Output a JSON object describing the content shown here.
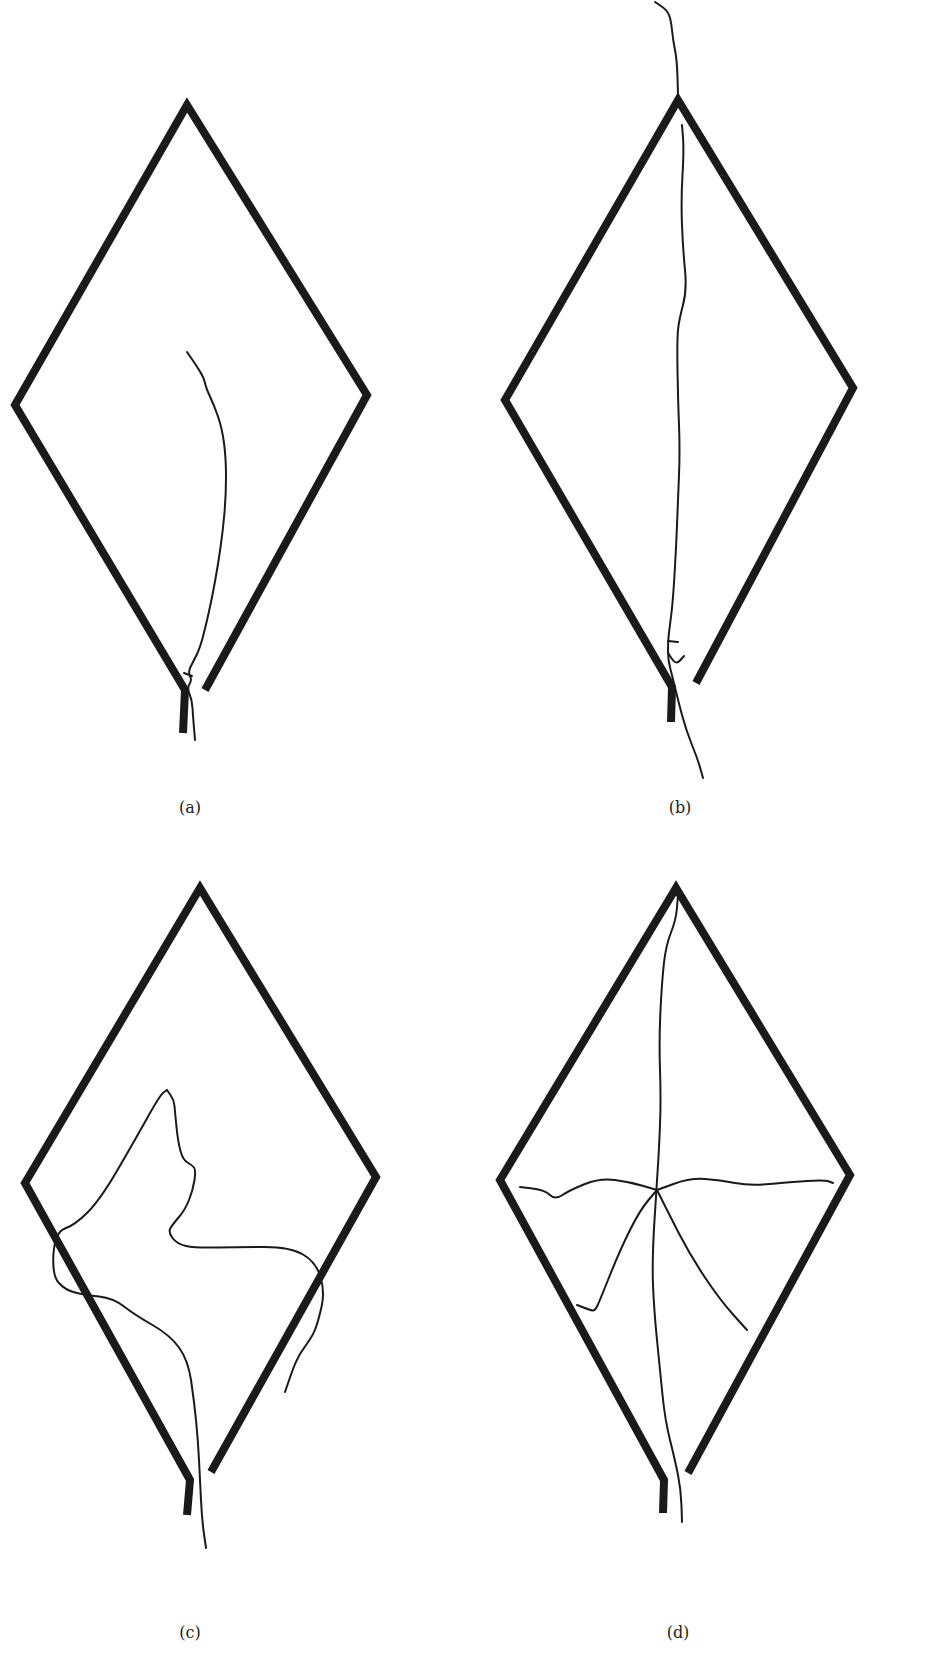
{
  "figure": {
    "colors": {
      "background": "#ffffff",
      "ink": "#1a1a1a",
      "label": "#222222"
    },
    "panels": [
      {
        "id": "a",
        "label": "(a)",
        "label_pos": [
          190,
          810
        ],
        "frame_left": [
          [
            205,
            690
          ],
          [
            367,
            395
          ],
          [
            187,
            105
          ],
          [
            15,
            405
          ],
          [
            185,
            690
          ],
          [
            183,
            733
          ]
        ],
        "cracks": [
          {
            "style": "solid",
            "points": [
              [
                187,
                352
              ],
              [
                196,
                365
              ],
              [
                204,
                378
              ],
              [
                206,
                388
              ],
              [
                214,
                405
              ],
              [
                222,
                428
              ],
              [
                226,
                458
              ],
              [
                226,
                495
              ],
              [
                223,
                530
              ],
              [
                218,
                565
              ],
              [
                212,
                598
              ],
              [
                206,
                625
              ],
              [
                200,
                648
              ],
              [
                193,
                662
              ],
              [
                188,
                672
              ],
              [
                192,
                680
              ],
              [
                187,
                688
              ],
              [
                192,
                700
              ],
              [
                193,
                716
              ],
              [
                195,
                740
              ]
            ]
          },
          {
            "style": "solid",
            "points": [
              [
                184,
                673
              ],
              [
                192,
                676
              ]
            ]
          }
        ]
      },
      {
        "id": "b",
        "label": "(b)",
        "label_pos": [
          680,
          810
        ],
        "frame_left": [
          [
            696,
            683
          ],
          [
            853,
            388
          ],
          [
            678,
            100
          ],
          [
            505,
            400
          ],
          [
            672,
            687
          ],
          [
            671,
            722
          ]
        ],
        "cracks": [
          {
            "style": "solid",
            "points": [
              [
                655,
                2
              ],
              [
                667,
                10
              ],
              [
                671,
                20
              ],
              [
                673,
                40
              ],
              [
                677,
                60
              ],
              [
                678,
                95
              ]
            ]
          },
          {
            "style": "solid",
            "points": [
              [
                682,
                125
              ],
              [
                684,
                150
              ],
              [
                681,
                200
              ],
              [
                683,
                250
              ],
              [
                687,
                290
              ],
              [
                679,
                320
              ],
              [
                677,
                340
              ],
              [
                678,
                400
              ],
              [
                680,
                450
              ],
              [
                678,
                500
              ],
              [
                676,
                550
              ],
              [
                673,
                600
              ],
              [
                670,
                625
              ],
              [
                668,
                640
              ],
              [
                668,
                660
              ],
              [
                672,
                675
              ],
              [
                678,
                700
              ],
              [
                686,
                730
              ],
              [
                698,
                760
              ],
              [
                703,
                778
              ]
            ]
          },
          {
            "style": "solid",
            "points": [
              [
                668,
                641
              ],
              [
                678,
                642
              ]
            ]
          },
          {
            "style": "solid",
            "points": [
              [
                668,
                653
              ],
              [
                676,
                665
              ],
              [
                684,
                656
              ]
            ]
          }
        ]
      },
      {
        "id": "c",
        "label": "(c)",
        "label_pos": [
          190,
          1635
        ],
        "frame_left": [
          [
            211,
            1472
          ],
          [
            376,
            1177
          ],
          [
            200,
            888
          ],
          [
            25,
            1183
          ],
          [
            190,
            1480
          ],
          [
            187,
            1515
          ]
        ],
        "cracks": [
          {
            "style": "solid",
            "points": [
              [
                167,
                1090
              ],
              [
                174,
                1100
              ],
              [
                175,
                1112
              ],
              [
                178,
                1142
              ],
              [
                183,
                1160
              ],
              [
                192,
                1165
              ],
              [
                196,
                1170
              ],
              [
                193,
                1190
              ],
              [
                185,
                1210
              ],
              [
                173,
                1224
              ],
              [
                168,
                1232
              ],
              [
                177,
                1244
              ],
              [
                195,
                1248
              ],
              [
                240,
                1247
              ],
              [
                290,
                1247
              ],
              [
                316,
                1262
              ],
              [
                325,
                1292
              ],
              [
                318,
                1322
              ],
              [
                313,
                1335
              ],
              [
                306,
                1345
              ],
              [
                296,
                1360
              ],
              [
                285,
                1392
              ]
            ]
          },
          {
            "style": "solid",
            "points": [
              [
                167,
                1090
              ],
              [
                160,
                1095
              ],
              [
                135,
                1140
              ],
              [
                100,
                1200
              ],
              [
                75,
                1225
              ],
              [
                55,
                1232
              ],
              [
                52,
                1275
              ],
              [
                65,
                1290
              ],
              [
                85,
                1295
              ],
              [
                113,
                1298
              ],
              [
                135,
                1315
              ],
              [
                170,
                1335
              ],
              [
                188,
                1360
              ],
              [
                194,
                1400
              ],
              [
                198,
                1440
              ],
              [
                200,
                1480
              ],
              [
                202,
                1520
              ],
              [
                206,
                1548
              ]
            ]
          }
        ]
      },
      {
        "id": "d",
        "label": "(d)",
        "label_pos": [
          678,
          1635
        ],
        "frame_left": [
          [
            688,
            1473
          ],
          [
            850,
            1175
          ],
          [
            676,
            888
          ],
          [
            500,
            1180
          ],
          [
            664,
            1480
          ],
          [
            663,
            1513
          ]
        ],
        "cracks": [
          {
            "style": "solid",
            "points": [
              [
                678,
                895
              ],
              [
                676,
                920
              ],
              [
                666,
                945
              ],
              [
                662,
                980
              ],
              [
                659,
                1040
              ],
              [
                661,
                1100
              ],
              [
                659,
                1150
              ],
              [
                657,
                1180
              ],
              [
                652,
                1260
              ],
              [
                654,
                1310
              ],
              [
                660,
                1370
              ],
              [
                665,
                1420
              ],
              [
                675,
                1460
              ],
              [
                681,
                1490
              ],
              [
                682,
                1522
              ]
            ]
          },
          {
            "style": "solid",
            "points": [
              [
                520,
                1187
              ],
              [
                545,
                1190
              ],
              [
                555,
                1200
              ],
              [
                570,
                1190
              ],
              [
                600,
                1178
              ],
              [
                630,
                1182
              ],
              [
                657,
                1190
              ]
            ]
          },
          {
            "style": "solid",
            "points": [
              [
                657,
                1190
              ],
              [
                690,
                1178
              ],
              [
                720,
                1180
              ],
              [
                750,
                1186
              ],
              [
                790,
                1182
              ],
              [
                825,
                1180
              ],
              [
                833,
                1183
              ]
            ]
          },
          {
            "style": "solid",
            "points": [
              [
                657,
                1190
              ],
              [
                640,
                1210
              ],
              [
                620,
                1250
              ],
              [
                600,
                1300
              ],
              [
                595,
                1311
              ],
              [
                590,
                1310
              ],
              [
                577,
                1305
              ]
            ]
          },
          {
            "style": "solid",
            "points": [
              [
                657,
                1190
              ],
              [
                668,
                1212
              ],
              [
                690,
                1255
              ],
              [
                720,
                1300
              ],
              [
                747,
                1330
              ]
            ]
          }
        ]
      }
    ]
  }
}
